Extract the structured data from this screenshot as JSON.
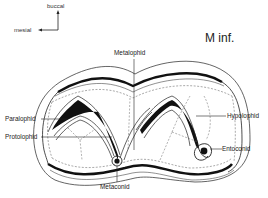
{
  "title": "M inf.",
  "orientation": {
    "up_label": "buccal",
    "left_label": "mesial"
  },
  "labels": {
    "metalophid": "Metalophid",
    "paralophid": "Paralophid",
    "protolophid": "Protolophid",
    "hypolophid": "Hypolophid",
    "entoconid": "Entoconid",
    "metaconid": "Metaconid"
  },
  "colors": {
    "ink": "#1a1a1a",
    "background": "#ffffff"
  }
}
